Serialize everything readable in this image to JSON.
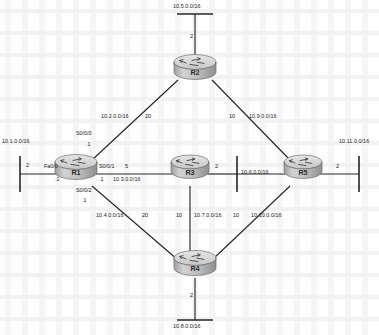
{
  "diagram": {
    "caption": "",
    "line_color": "#262626",
    "router_body_color": "#b9b9b9",
    "router_top_color": "#d8d8d8",
    "text_color": "#1b1b1b"
  },
  "routers": [
    {
      "id": "r1",
      "name": "R1",
      "x": 76,
      "y": 172
    },
    {
      "id": "r2",
      "name": "R2",
      "x": 195,
      "y": 72
    },
    {
      "id": "r3",
      "name": "R3",
      "x": 190,
      "y": 172
    },
    {
      "id": "r4",
      "name": "R4",
      "x": 195,
      "y": 268
    },
    {
      "id": "r5",
      "name": "R5",
      "x": 303,
      "y": 172
    }
  ],
  "networks": [
    {
      "id": "n1",
      "label": "10.1.0.0/16",
      "cost": "2"
    },
    {
      "id": "n2",
      "label": "10.2.0.0/16",
      "cost": "20"
    },
    {
      "id": "n3",
      "label": "10.3.0.0/16",
      "cost": "5"
    },
    {
      "id": "n4",
      "label": "10.4.0.0/16",
      "cost": "20"
    },
    {
      "id": "n5",
      "label": "10.5.0.0/16",
      "cost": "2"
    },
    {
      "id": "n6",
      "label": "10.6.0.0/16",
      "cost": "2"
    },
    {
      "id": "n7",
      "label": "10.7.0.0/16",
      "cost": "10"
    },
    {
      "id": "n8",
      "label": "10.8.0.0/16",
      "cost": "2"
    },
    {
      "id": "n9",
      "label": "10.9.0.0/16",
      "cost": "10"
    },
    {
      "id": "n10",
      "label": "10.10.0.0/16",
      "cost": "10"
    },
    {
      "id": "n11",
      "label": "10.11.0.0/16",
      "cost": "2"
    }
  ],
  "labels": {
    "net_10_5": "10.5.0.0/16",
    "cost_10_5": "2",
    "net_10_2": "10.2.0.0/16",
    "cost_10_2": "20",
    "net_10_9": "10.9.0.0/16",
    "cost_10_9": "10",
    "net_10_1": "10.1.0.0/16",
    "cost_10_1": "2",
    "net_10_3": "10.3.0.0/16",
    "cost_10_3": "5",
    "net_10_6": "10.6.0.0/16",
    "cost_10_6": "2",
    "net_10_11": "10.11.0.0/16",
    "cost_10_11": "2",
    "net_10_4": "10.4.0.0/16",
    "cost_10_4": "20",
    "net_10_7": "10.7.0.0/16",
    "cost_10_7_left": "10",
    "cost_10_7_right": "10",
    "net_10_10": "10.10.0.0/16",
    "cost_10_10": "10",
    "net_10_8": "10.8.0.0/16",
    "cost_10_8": "2"
  },
  "interfaces": {
    "r1_fa0_0": "Fa0/0",
    "r1_s0_0_0": "S0/0/0",
    "r1_s0_0_1": "S0/0/1",
    "r1_s0_0_2": "S0/0/2"
  },
  "ip_hosts": {
    "r1_fa0_0_host": ".1",
    "r1_s0_0_0_host": ".1",
    "r1_s0_0_1_host": ".1",
    "r1_s0_0_2_host": ".1"
  },
  "router_names": {
    "r1": "R1",
    "r2": "R2",
    "r3": "R3",
    "r4": "R4",
    "r5": "R5"
  }
}
